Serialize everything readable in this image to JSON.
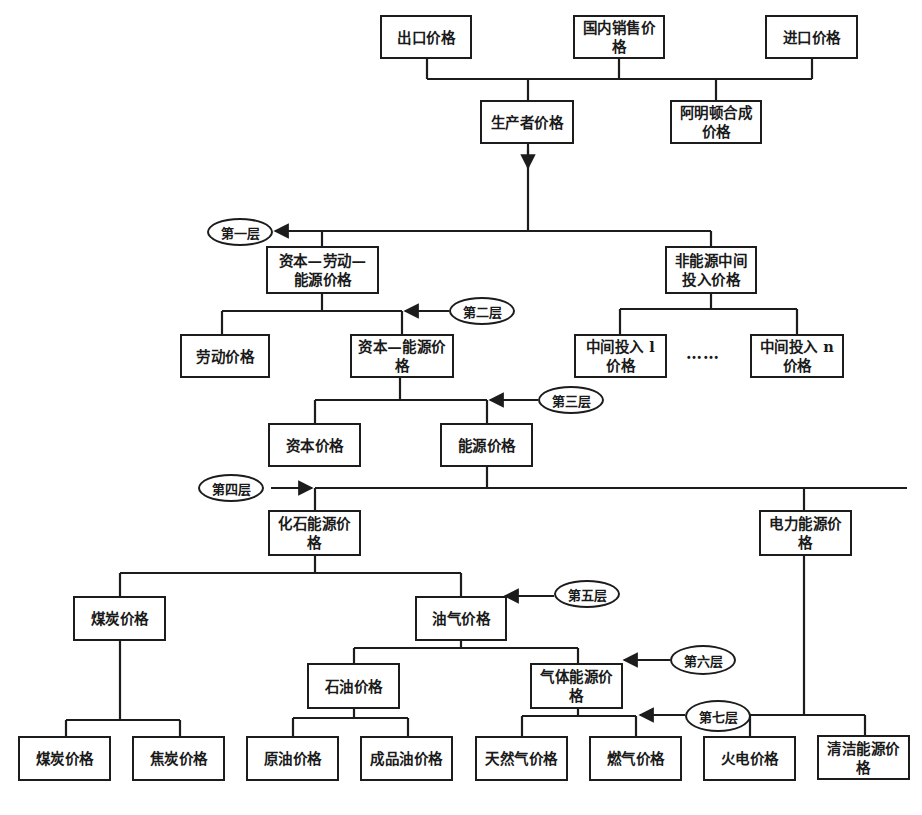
{
  "diagram": {
    "type": "hierarchical price-structure tree",
    "top": {
      "export": "出口价格",
      "domestic_sales": "国内销售价格",
      "import": "进口价格",
      "producer": "生产者价格",
      "armington": "阿明顿合成价格"
    },
    "layers": {
      "l1": "第一层",
      "l2": "第二层",
      "l3": "第三层",
      "l4": "第四层",
      "l5": "第五层",
      "l6": "第六层",
      "l7": "第七层"
    },
    "nodes": {
      "kle": "资本—劳动—能源价格",
      "non_energy_intermediate": "非能源中间投入价格",
      "labor": "劳动价格",
      "ke": "资本—能源价格",
      "intermediate_1": "中间投入 l 价格",
      "intermediate_n": "中间投入 n 价格",
      "ellipsis": "……",
      "capital": "资本价格",
      "energy": "能源价格",
      "fossil_energy": "化石能源价格",
      "electric_energy": "电力能源价格",
      "coal_group": "煤炭价格",
      "oil_gas": "油气价格",
      "petroleum": "石油价格",
      "gas_energy": "气体能源价格",
      "coal": "煤炭价格",
      "coke": "焦炭价格",
      "crude_oil": "原油价格",
      "refined_oil": "成品油价格",
      "natural_gas": "天然气价格",
      "fuel_gas": "燃气价格",
      "thermal_power": "火电价格",
      "clean_energy": "清洁能源价格"
    },
    "colors": {
      "line": "#1c1c1c",
      "background": "#ffffff"
    }
  }
}
